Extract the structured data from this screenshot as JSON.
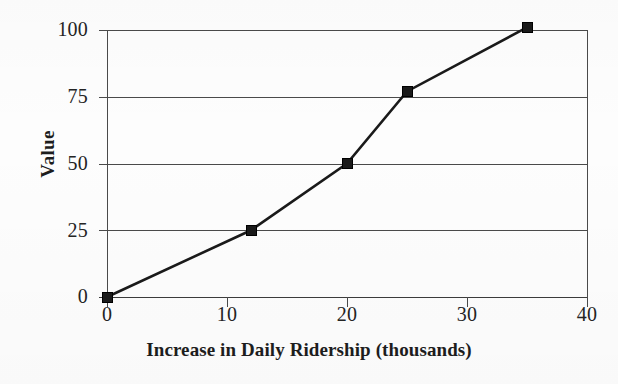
{
  "chart_data": {
    "type": "line",
    "title": "",
    "xlabel": "Increase in Daily Ridership (thousands)",
    "ylabel": "Value",
    "xlim": [
      0,
      40
    ],
    "ylim": [
      0,
      100
    ],
    "xticks": [
      0,
      10,
      20,
      30,
      40
    ],
    "yticks": [
      0,
      25,
      50,
      75,
      100
    ],
    "xtick_labels": [
      "0",
      "10",
      "20",
      "30",
      "40"
    ],
    "ytick_labels": [
      "0",
      "25",
      "50",
      "75",
      "100"
    ],
    "grid": "horizontal",
    "legend": "none",
    "marker": "square",
    "line_color": "#1a1a1a",
    "marker_color": "#1a1a1a",
    "grid_color": "#4a4a4a",
    "x": [
      0,
      12,
      20,
      25,
      35
    ],
    "values": [
      0,
      25,
      50,
      77,
      101
    ],
    "series": [
      {
        "name": "Value",
        "points": [
          {
            "x": 0,
            "y": 0
          },
          {
            "x": 12,
            "y": 25
          },
          {
            "x": 20,
            "y": 50
          },
          {
            "x": 25,
            "y": 77
          },
          {
            "x": 35,
            "y": 101
          }
        ]
      }
    ]
  },
  "axes": {
    "y_labels": [
      {
        "text": "100",
        "value": 100
      },
      {
        "text": "75",
        "value": 75
      },
      {
        "text": "50",
        "value": 50
      },
      {
        "text": "25",
        "value": 25
      },
      {
        "text": "0",
        "value": 0
      }
    ],
    "x_labels": [
      {
        "text": "0",
        "value": 0
      },
      {
        "text": "10",
        "value": 10
      },
      {
        "text": "20",
        "value": 20
      },
      {
        "text": "30",
        "value": 30
      },
      {
        "text": "40",
        "value": 40
      }
    ],
    "y_title": "Value",
    "x_title": "Increase in Daily Ridership (thousands)"
  }
}
